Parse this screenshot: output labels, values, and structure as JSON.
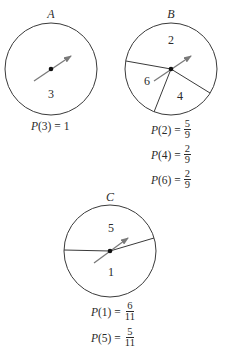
{
  "spinners": [
    {
      "id": "A",
      "title": "A",
      "sectors": [
        {
          "label": "3"
        }
      ],
      "probabilities": [
        {
          "outcome": "3",
          "text": "P(3) = 1",
          "value": "1"
        }
      ]
    },
    {
      "id": "B",
      "title": "B",
      "sectors": [
        {
          "label": "2"
        },
        {
          "label": "6"
        },
        {
          "label": "4"
        }
      ],
      "probabilities": [
        {
          "outcome": "2",
          "numerator": "5",
          "denominator": "9"
        },
        {
          "outcome": "4",
          "numerator": "2",
          "denominator": "9"
        },
        {
          "outcome": "6",
          "numerator": "2",
          "denominator": "9"
        }
      ]
    },
    {
      "id": "C",
      "title": "C",
      "sectors": [
        {
          "label": "5"
        },
        {
          "label": "1"
        }
      ],
      "probabilities": [
        {
          "outcome": "1",
          "numerator": "6",
          "denominator": "11"
        },
        {
          "outcome": "5",
          "numerator": "5",
          "denominator": "11"
        }
      ]
    }
  ],
  "labels": {
    "pA3_lhs": "P(3) = 1",
    "pB2_lhs": "(2) =",
    "pB4_lhs": "(4) =",
    "pB6_lhs": "(6) =",
    "pC1_lhs": "(1) =",
    "pC5_lhs": "(5) =",
    "P": "P"
  },
  "colors": {
    "stroke": "#3a3a3a",
    "arrow": "#7a7a7a",
    "text": "#2a2a2a"
  }
}
